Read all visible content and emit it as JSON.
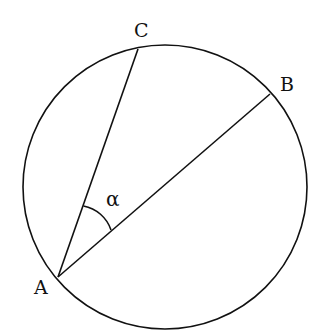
{
  "diagram": {
    "type": "circle-inscribed-angle",
    "circle": {
      "cx": 165,
      "cy": 187,
      "r": 142
    },
    "points": {
      "A": {
        "label": "A",
        "x": 58,
        "y": 277
      },
      "B": {
        "label": "B",
        "x": 270,
        "y": 94
      },
      "C": {
        "label": "C",
        "x": 138,
        "y": 49
      }
    },
    "chords": [
      {
        "from": "A",
        "to": "C"
      },
      {
        "from": "A",
        "to": "B"
      }
    ],
    "angle": {
      "vertex": "A",
      "between": [
        "C",
        "B"
      ],
      "label": "α"
    },
    "colors": {
      "stroke": "#111111",
      "background": "#ffffff"
    }
  }
}
